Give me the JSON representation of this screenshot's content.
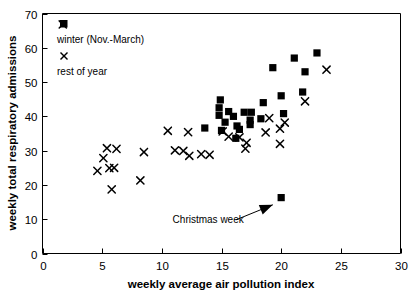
{
  "chart_data": {
    "type": "scatter",
    "title": "",
    "xlabel": "weekly average air pollution index",
    "ylabel": "weekly total respiratory admissions",
    "xlim": [
      0,
      30
    ],
    "ylim": [
      0,
      70
    ],
    "xticks": [
      "0",
      "5",
      "10",
      "15",
      "20",
      "25",
      "30"
    ],
    "yticks": [
      "0",
      "10",
      "20",
      "30",
      "40",
      "50",
      "60",
      "70"
    ],
    "grid": false,
    "legend_position": "upper-left-inside",
    "series": [
      {
        "name": "winter (Nov.-March)",
        "marker": "filled-square",
        "color": "#000000",
        "points": [
          [
            14.8,
            42.5
          ],
          [
            14.8,
            40.3
          ],
          [
            15.6,
            41.4
          ],
          [
            16.0,
            40.0
          ],
          [
            16.9,
            41.2
          ],
          [
            17.5,
            41.2
          ],
          [
            15.3,
            38.3
          ],
          [
            16.3,
            37.2
          ],
          [
            15.0,
            35.9
          ],
          [
            16.5,
            36.2
          ],
          [
            17.4,
            38.9
          ],
          [
            17.4,
            37.6
          ],
          [
            18.5,
            44.0
          ],
          [
            18.3,
            39.3
          ],
          [
            20.0,
            46.0
          ],
          [
            20.2,
            40.8
          ],
          [
            16.2,
            33.6
          ],
          [
            13.6,
            36.6
          ],
          [
            14.9,
            44.8
          ],
          [
            22.0,
            53.0
          ],
          [
            23.0,
            58.5
          ],
          [
            21.1,
            57.0
          ],
          [
            19.3,
            54.2
          ],
          [
            21.8,
            47.1
          ],
          [
            20.0,
            16.3
          ]
        ]
      },
      {
        "name": "rest of year",
        "marker": "cross",
        "color": "#000000",
        "points": [
          [
            1.7,
            66.8
          ],
          [
            4.6,
            24.1
          ],
          [
            5.1,
            27.8
          ],
          [
            5.6,
            24.9
          ],
          [
            6.0,
            25.0
          ],
          [
            5.4,
            30.7
          ],
          [
            5.8,
            18.7
          ],
          [
            6.2,
            30.5
          ],
          [
            8.5,
            29.6
          ],
          [
            8.2,
            21.3
          ],
          [
            10.5,
            35.8
          ],
          [
            11.1,
            30.1
          ],
          [
            11.8,
            29.9
          ],
          [
            12.3,
            28.5
          ],
          [
            12.2,
            35.4
          ],
          [
            13.3,
            29.0
          ],
          [
            14.0,
            28.8
          ],
          [
            15.1,
            35.6
          ],
          [
            15.6,
            34.1
          ],
          [
            16.5,
            33.9
          ],
          [
            17.1,
            32.3
          ],
          [
            17.0,
            30.6
          ],
          [
            18.7,
            35.3
          ],
          [
            19.0,
            39.5
          ],
          [
            20.3,
            38.2
          ],
          [
            22.0,
            44.4
          ],
          [
            23.8,
            53.6
          ],
          [
            19.9,
            32.0
          ],
          [
            19.9,
            36.4
          ]
        ]
      }
    ],
    "annotations": [
      {
        "name": "christmas-week",
        "text": "Christmas week",
        "text_x": 10.9,
        "text_y": 8.9,
        "arrow_from_x": 16.2,
        "arrow_from_y": 9.8,
        "arrow_to_x": 19.3,
        "arrow_to_y": 14.2
      }
    ],
    "legend_entries": [
      {
        "label": "winter (Nov.-March)",
        "marker": "filled-square"
      },
      {
        "label": "rest of year",
        "marker": "cross"
      }
    ]
  }
}
